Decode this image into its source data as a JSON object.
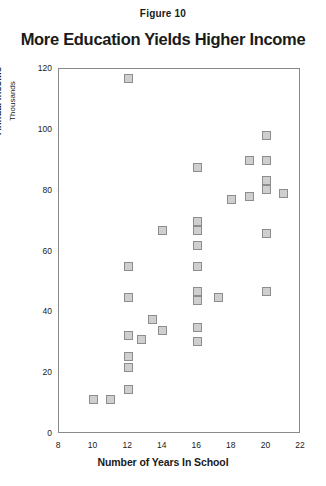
{
  "figure": {
    "caption": "Figure 10",
    "title": "More Education Yields Higher Income"
  },
  "chart_data": {
    "type": "scatter",
    "title": "More Education Yields Higher Income",
    "caption": "Figure 10",
    "xlabel": "Number of Years In School",
    "ylabel": "Annual Income",
    "ylabel_sub": "Thousands",
    "xlim": [
      8,
      22
    ],
    "ylim": [
      0,
      120
    ],
    "xticks": [
      8,
      10,
      12,
      14,
      16,
      18,
      20,
      22
    ],
    "yticks": [
      0,
      20,
      40,
      60,
      80,
      100,
      120
    ],
    "grid": false,
    "legend": null,
    "marker": {
      "shape": "square",
      "fill": "#cfcfcf",
      "edge": "#8d8d8d"
    },
    "points": [
      {
        "x": 10.0,
        "y": 11.5
      },
      {
        "x": 11.0,
        "y": 11.5
      },
      {
        "x": 12.0,
        "y": 14.5
      },
      {
        "x": 12.0,
        "y": 22.0
      },
      {
        "x": 12.0,
        "y": 25.5
      },
      {
        "x": 12.0,
        "y": 32.5
      },
      {
        "x": 12.0,
        "y": 45.0
      },
      {
        "x": 12.0,
        "y": 55.0
      },
      {
        "x": 12.0,
        "y": 117.0
      },
      {
        "x": 12.8,
        "y": 31.0
      },
      {
        "x": 13.4,
        "y": 37.5
      },
      {
        "x": 14.0,
        "y": 34.0
      },
      {
        "x": 14.0,
        "y": 67.0
      },
      {
        "x": 16.0,
        "y": 30.5
      },
      {
        "x": 16.0,
        "y": 35.0
      },
      {
        "x": 16.0,
        "y": 44.0
      },
      {
        "x": 16.0,
        "y": 47.0
      },
      {
        "x": 16.0,
        "y": 55.0
      },
      {
        "x": 16.0,
        "y": 62.0
      },
      {
        "x": 16.0,
        "y": 67.0
      },
      {
        "x": 16.0,
        "y": 70.0
      },
      {
        "x": 16.0,
        "y": 87.5
      },
      {
        "x": 17.2,
        "y": 45.0
      },
      {
        "x": 18.0,
        "y": 77.0
      },
      {
        "x": 19.0,
        "y": 78.0
      },
      {
        "x": 19.0,
        "y": 90.0
      },
      {
        "x": 20.0,
        "y": 47.0
      },
      {
        "x": 20.0,
        "y": 66.0
      },
      {
        "x": 20.0,
        "y": 80.5
      },
      {
        "x": 20.0,
        "y": 83.5
      },
      {
        "x": 20.0,
        "y": 90.0
      },
      {
        "x": 20.0,
        "y": 98.0
      },
      {
        "x": 21.0,
        "y": 79.0
      }
    ]
  }
}
